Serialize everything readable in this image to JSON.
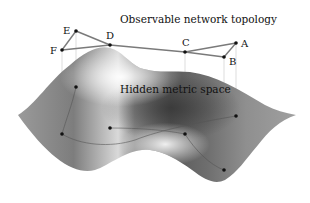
{
  "figure": {
    "top_label": "Observable network topology",
    "surface_label": "Hidden metric space",
    "colors": {
      "edge": "#7a7a7a",
      "node": "#111111",
      "projection": "#bdbdbd",
      "surface_dark": "#3a3a3a",
      "surface_mid": "#8a8a8a",
      "surface_light": "#f2f2f2"
    },
    "nodes": [
      {
        "id": "A",
        "label": "A"
      },
      {
        "id": "B",
        "label": "B"
      },
      {
        "id": "C",
        "label": "C"
      },
      {
        "id": "D",
        "label": "D"
      },
      {
        "id": "E",
        "label": "E"
      },
      {
        "id": "F",
        "label": "F"
      }
    ],
    "edges": [
      [
        "E",
        "F"
      ],
      [
        "E",
        "D"
      ],
      [
        "D",
        "C"
      ],
      [
        "C",
        "A"
      ],
      [
        "A",
        "B"
      ],
      [
        "B",
        "C"
      ],
      [
        "D",
        "F"
      ]
    ]
  }
}
